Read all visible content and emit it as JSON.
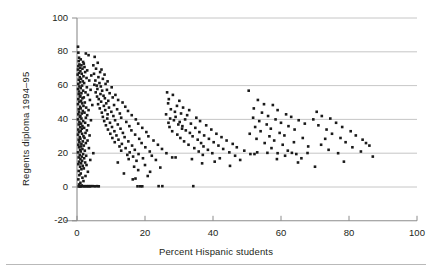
{
  "figure": {
    "background": "#ffffff",
    "ink_color": "#231f20",
    "grid_color": "#b8b8b8",
    "axis_color": "#8c8c8c",
    "point_color": "#1a1a1a"
  },
  "axes": {
    "x_title": "Percent Hispanic students",
    "y_title": "Regents diploma 1994–95",
    "x_ticklabels": [
      "0",
      "20",
      "40",
      "60",
      "80",
      "100"
    ],
    "y_ticklabels": [
      "-20",
      "0",
      "20",
      "40",
      "60",
      "80",
      "100"
    ]
  },
  "chart_data": {
    "type": "scatter",
    "title": "",
    "xlabel": "Percent Hispanic students",
    "ylabel": "Regents diploma 1994–95",
    "xlim": [
      0,
      100
    ],
    "ylim": [
      -20,
      100
    ],
    "xticks": [
      0,
      20,
      40,
      60,
      80,
      100
    ],
    "yticks": [
      -20,
      0,
      20,
      40,
      60,
      80,
      100
    ],
    "grid": "horizontal",
    "gridlines_y": [
      0,
      20,
      40,
      60,
      80,
      100
    ],
    "legend": null,
    "marker": "square",
    "marker_size_px": 2.6,
    "n_points": 487,
    "points": [
      [
        0.3,
        83.0
      ],
      [
        0.4,
        79.5
      ],
      [
        2.6,
        79.0
      ],
      [
        3.4,
        78.0
      ],
      [
        0.6,
        76.5
      ],
      [
        1.1,
        75.5
      ],
      [
        0.5,
        74.5
      ],
      [
        1.8,
        74.0
      ],
      [
        2.0,
        73.0
      ],
      [
        0.7,
        72.5
      ],
      [
        1.3,
        72.0
      ],
      [
        0.4,
        71.5
      ],
      [
        2.2,
        71.0
      ],
      [
        0.9,
        70.5
      ],
      [
        1.6,
        70.0
      ],
      [
        0.3,
        69.5
      ],
      [
        3.0,
        69.0
      ],
      [
        1.0,
        68.5
      ],
      [
        2.4,
        68.0
      ],
      [
        0.6,
        67.5
      ],
      [
        1.4,
        67.0
      ],
      [
        0.2,
        66.5
      ],
      [
        4.2,
        66.0
      ],
      [
        1.9,
        65.5
      ],
      [
        0.8,
        65.0
      ],
      [
        2.8,
        64.5
      ],
      [
        1.2,
        64.0
      ],
      [
        0.5,
        63.5
      ],
      [
        3.6,
        63.0
      ],
      [
        1.7,
        62.5
      ],
      [
        0.9,
        62.0
      ],
      [
        2.1,
        61.5
      ],
      [
        0.4,
        61.0
      ],
      [
        5.1,
        60.5
      ],
      [
        1.5,
        60.0
      ],
      [
        0.7,
        59.5
      ],
      [
        2.9,
        59.0
      ],
      [
        1.1,
        58.5
      ],
      [
        0.3,
        58.0
      ],
      [
        4.0,
        57.5
      ],
      [
        1.8,
        57.0
      ],
      [
        0.6,
        56.5
      ],
      [
        2.5,
        56.0
      ],
      [
        1.3,
        55.5
      ],
      [
        0.5,
        55.0
      ],
      [
        3.2,
        54.5
      ],
      [
        1.0,
        54.0
      ],
      [
        0.8,
        53.5
      ],
      [
        2.0,
        53.0
      ],
      [
        1.6,
        52.5
      ],
      [
        0.4,
        52.0
      ],
      [
        3.8,
        51.5
      ],
      [
        1.2,
        51.0
      ],
      [
        0.7,
        50.5
      ],
      [
        2.3,
        50.0
      ],
      [
        1.5,
        49.5
      ],
      [
        0.3,
        49.0
      ],
      [
        4.5,
        48.5
      ],
      [
        1.9,
        48.0
      ],
      [
        0.9,
        47.5
      ],
      [
        2.7,
        47.0
      ],
      [
        1.1,
        46.5
      ],
      [
        0.5,
        46.0
      ],
      [
        3.4,
        45.5
      ],
      [
        1.7,
        45.0
      ],
      [
        0.6,
        44.5
      ],
      [
        2.2,
        44.0
      ],
      [
        1.4,
        43.5
      ],
      [
        0.4,
        43.0
      ],
      [
        3.0,
        42.5
      ],
      [
        1.0,
        42.0
      ],
      [
        0.8,
        41.5
      ],
      [
        2.6,
        41.0
      ],
      [
        1.3,
        40.5
      ],
      [
        0.3,
        40.0
      ],
      [
        4.1,
        39.5
      ],
      [
        1.8,
        39.0
      ],
      [
        0.7,
        38.5
      ],
      [
        2.4,
        38.0
      ],
      [
        1.2,
        37.5
      ],
      [
        0.5,
        37.0
      ],
      [
        3.3,
        36.5
      ],
      [
        1.6,
        36.0
      ],
      [
        0.9,
        35.5
      ],
      [
        2.1,
        35.0
      ],
      [
        1.4,
        34.5
      ],
      [
        0.4,
        34.0
      ],
      [
        2.9,
        33.5
      ],
      [
        1.1,
        33.0
      ],
      [
        0.6,
        32.5
      ],
      [
        2.5,
        32.0
      ],
      [
        1.5,
        31.5
      ],
      [
        0.3,
        31.0
      ],
      [
        3.7,
        30.5
      ],
      [
        1.9,
        30.0
      ],
      [
        0.8,
        29.5
      ],
      [
        2.2,
        29.0
      ],
      [
        1.0,
        28.5
      ],
      [
        0.5,
        28.0
      ],
      [
        3.1,
        27.5
      ],
      [
        1.7,
        27.0
      ],
      [
        0.7,
        26.5
      ],
      [
        2.6,
        26.0
      ],
      [
        1.3,
        25.5
      ],
      [
        0.4,
        25.0
      ],
      [
        2.0,
        24.5
      ],
      [
        1.2,
        24.0
      ],
      [
        0.6,
        23.5
      ],
      [
        3.5,
        23.0
      ],
      [
        1.6,
        22.5
      ],
      [
        0.9,
        22.0
      ],
      [
        2.3,
        21.5
      ],
      [
        1.1,
        21.0
      ],
      [
        0.3,
        20.5
      ],
      [
        4.8,
        20.0
      ],
      [
        1.8,
        19.5
      ],
      [
        0.8,
        19.0
      ],
      [
        2.7,
        18.5
      ],
      [
        1.4,
        18.0
      ],
      [
        0.5,
        17.5
      ],
      [
        2.1,
        17.0
      ],
      [
        1.0,
        16.5
      ],
      [
        3.9,
        16.0
      ],
      [
        1.5,
        15.5
      ],
      [
        0.6,
        15.0
      ],
      [
        2.4,
        14.5
      ],
      [
        1.2,
        14.0
      ],
      [
        0.4,
        13.5
      ],
      [
        2.8,
        13.0
      ],
      [
        1.7,
        12.5
      ],
      [
        0.9,
        12.0
      ],
      [
        2.0,
        11.0
      ],
      [
        1.3,
        10.5
      ],
      [
        0.5,
        9.5
      ],
      [
        3.2,
        9.0
      ],
      [
        1.1,
        8.0
      ],
      [
        0.7,
        7.0
      ],
      [
        2.5,
        6.5
      ],
      [
        1.6,
        5.5
      ],
      [
        0.4,
        4.5
      ],
      [
        1.9,
        3.5
      ],
      [
        1.0,
        2.5
      ],
      [
        0.6,
        1.5
      ],
      [
        1.4,
        0.9
      ],
      [
        0.8,
        0.6
      ],
      [
        2.2,
        0.5
      ],
      [
        2.9,
        0.5
      ],
      [
        3.5,
        0.5
      ],
      [
        4.1,
        0.5
      ],
      [
        4.7,
        0.5
      ],
      [
        1.2,
        0.4
      ],
      [
        1.7,
        0.4
      ],
      [
        2.4,
        0.4
      ],
      [
        3.1,
        0.4
      ],
      [
        3.8,
        0.4
      ],
      [
        0.5,
        0.3
      ],
      [
        1.0,
        0.3
      ],
      [
        5.3,
        0.4
      ],
      [
        5.9,
        0.5
      ],
      [
        6.4,
        0.4
      ],
      [
        5.2,
        77.0
      ],
      [
        6.1,
        73.5
      ],
      [
        4.8,
        72.0
      ],
      [
        5.6,
        70.0
      ],
      [
        7.2,
        69.5
      ],
      [
        6.8,
        68.0
      ],
      [
        5.0,
        67.0
      ],
      [
        8.1,
        66.5
      ],
      [
        6.3,
        65.0
      ],
      [
        7.6,
        64.0
      ],
      [
        5.4,
        63.0
      ],
      [
        9.0,
        62.5
      ],
      [
        6.6,
        61.5
      ],
      [
        8.4,
        61.0
      ],
      [
        5.8,
        60.0
      ],
      [
        7.0,
        59.5
      ],
      [
        10.2,
        59.0
      ],
      [
        6.0,
        58.0
      ],
      [
        8.8,
        57.5
      ],
      [
        7.4,
        57.0
      ],
      [
        5.5,
        56.0
      ],
      [
        9.6,
        55.5
      ],
      [
        6.9,
        55.0
      ],
      [
        11.3,
        54.5
      ],
      [
        7.8,
        54.0
      ],
      [
        5.9,
        53.5
      ],
      [
        10.5,
        53.0
      ],
      [
        8.2,
        52.5
      ],
      [
        6.4,
        52.0
      ],
      [
        12.1,
        51.5
      ],
      [
        9.2,
        51.0
      ],
      [
        7.1,
        50.5
      ],
      [
        13.4,
        50.0
      ],
      [
        8.6,
        49.5
      ],
      [
        6.2,
        49.0
      ],
      [
        10.9,
        48.5
      ],
      [
        7.9,
        48.0
      ],
      [
        14.2,
        47.5
      ],
      [
        9.4,
        47.0
      ],
      [
        6.7,
        46.5
      ],
      [
        11.8,
        46.0
      ],
      [
        8.3,
        45.5
      ],
      [
        15.0,
        45.0
      ],
      [
        10.1,
        44.5
      ],
      [
        7.3,
        44.0
      ],
      [
        12.6,
        43.5
      ],
      [
        9.0,
        43.0
      ],
      [
        16.1,
        42.5
      ],
      [
        10.7,
        42.0
      ],
      [
        7.6,
        41.5
      ],
      [
        13.0,
        41.0
      ],
      [
        8.9,
        40.5
      ],
      [
        17.3,
        40.0
      ],
      [
        11.2,
        39.5
      ],
      [
        8.0,
        39.0
      ],
      [
        14.5,
        38.5
      ],
      [
        9.7,
        38.0
      ],
      [
        18.0,
        37.5
      ],
      [
        12.0,
        37.0
      ],
      [
        8.5,
        36.5
      ],
      [
        15.4,
        36.0
      ],
      [
        10.3,
        35.5
      ],
      [
        19.2,
        35.0
      ],
      [
        12.8,
        34.5
      ],
      [
        9.1,
        34.0
      ],
      [
        16.0,
        33.5
      ],
      [
        11.0,
        33.0
      ],
      [
        20.4,
        32.5
      ],
      [
        13.5,
        32.0
      ],
      [
        9.8,
        31.5
      ],
      [
        17.1,
        31.0
      ],
      [
        11.6,
        30.5
      ],
      [
        21.0,
        30.0
      ],
      [
        14.0,
        29.5
      ],
      [
        10.4,
        29.0
      ],
      [
        18.3,
        28.5
      ],
      [
        12.2,
        28.0
      ],
      [
        22.5,
        27.5
      ],
      [
        15.1,
        27.0
      ],
      [
        11.1,
        26.5
      ],
      [
        19.0,
        26.0
      ],
      [
        13.2,
        25.5
      ],
      [
        23.8,
        25.0
      ],
      [
        16.2,
        24.5
      ],
      [
        12.5,
        24.0
      ],
      [
        20.1,
        23.5
      ],
      [
        14.3,
        23.0
      ],
      [
        25.0,
        22.5
      ],
      [
        17.0,
        22.0
      ],
      [
        13.0,
        21.5
      ],
      [
        21.4,
        21.0
      ],
      [
        15.5,
        20.5
      ],
      [
        26.3,
        20.0
      ],
      [
        18.1,
        19.5
      ],
      [
        14.8,
        19.0
      ],
      [
        22.0,
        18.5
      ],
      [
        16.5,
        18.0
      ],
      [
        28.0,
        17.5
      ],
      [
        19.4,
        17.0
      ],
      [
        15.2,
        16.5
      ],
      [
        23.2,
        16.0
      ],
      [
        17.5,
        15.5
      ],
      [
        12.0,
        14.5
      ],
      [
        20.0,
        13.0
      ],
      [
        16.8,
        12.0
      ],
      [
        24.5,
        11.5
      ],
      [
        18.0,
        10.0
      ],
      [
        21.5,
        9.0
      ],
      [
        13.8,
        8.0
      ],
      [
        17.2,
        5.0
      ],
      [
        20.8,
        6.5
      ],
      [
        16.4,
        4.5
      ],
      [
        24.0,
        0.5
      ],
      [
        25.1,
        0.5
      ],
      [
        18.6,
        0.4
      ],
      [
        19.2,
        0.4
      ],
      [
        34.2,
        0.5
      ],
      [
        17.8,
        0.4
      ],
      [
        26.5,
        56.0
      ],
      [
        28.2,
        54.5
      ],
      [
        27.0,
        52.0
      ],
      [
        30.1,
        51.0
      ],
      [
        26.8,
        49.5
      ],
      [
        29.4,
        48.0
      ],
      [
        31.2,
        47.0
      ],
      [
        27.6,
        46.0
      ],
      [
        33.0,
        45.5
      ],
      [
        28.8,
        44.5
      ],
      [
        30.6,
        43.5
      ],
      [
        26.2,
        43.0
      ],
      [
        32.4,
        42.5
      ],
      [
        29.0,
        41.5
      ],
      [
        35.1,
        41.0
      ],
      [
        27.4,
        40.5
      ],
      [
        31.8,
        40.0
      ],
      [
        28.5,
        39.5
      ],
      [
        36.2,
        39.0
      ],
      [
        30.2,
        38.5
      ],
      [
        26.9,
        38.0
      ],
      [
        33.5,
        37.5
      ],
      [
        29.8,
        37.0
      ],
      [
        38.0,
        36.5
      ],
      [
        31.0,
        36.0
      ],
      [
        27.2,
        35.5
      ],
      [
        34.8,
        35.0
      ],
      [
        30.9,
        34.5
      ],
      [
        39.5,
        34.0
      ],
      [
        32.0,
        33.5
      ],
      [
        28.0,
        33.0
      ],
      [
        36.0,
        32.5
      ],
      [
        33.2,
        32.0
      ],
      [
        41.0,
        31.5
      ],
      [
        29.5,
        31.0
      ],
      [
        37.4,
        30.5
      ],
      [
        34.0,
        30.0
      ],
      [
        42.5,
        29.5
      ],
      [
        30.4,
        29.0
      ],
      [
        38.8,
        28.5
      ],
      [
        35.5,
        28.0
      ],
      [
        44.0,
        27.5
      ],
      [
        31.5,
        27.0
      ],
      [
        40.2,
        26.5
      ],
      [
        36.5,
        26.0
      ],
      [
        45.8,
        25.5
      ],
      [
        32.8,
        25.0
      ],
      [
        41.6,
        24.5
      ],
      [
        37.2,
        24.0
      ],
      [
        47.0,
        23.5
      ],
      [
        34.5,
        23.0
      ],
      [
        43.0,
        22.5
      ],
      [
        38.5,
        22.0
      ],
      [
        49.2,
        21.5
      ],
      [
        35.8,
        21.0
      ],
      [
        44.8,
        20.5
      ],
      [
        39.8,
        20.0
      ],
      [
        51.0,
        19.5
      ],
      [
        37.0,
        19.0
      ],
      [
        46.5,
        18.5
      ],
      [
        29.0,
        17.5
      ],
      [
        42.0,
        17.0
      ],
      [
        33.8,
        16.5
      ],
      [
        48.0,
        16.0
      ],
      [
        40.5,
        15.0
      ],
      [
        45.0,
        12.5
      ],
      [
        36.8,
        14.0
      ],
      [
        50.5,
        57.0
      ],
      [
        53.2,
        51.5
      ],
      [
        55.0,
        49.0
      ],
      [
        57.6,
        48.5
      ],
      [
        52.0,
        46.5
      ],
      [
        59.0,
        45.5
      ],
      [
        54.4,
        44.0
      ],
      [
        61.5,
        43.0
      ],
      [
        56.2,
        42.0
      ],
      [
        63.0,
        41.5
      ],
      [
        51.8,
        41.0
      ],
      [
        58.4,
        40.0
      ],
      [
        65.2,
        39.5
      ],
      [
        53.6,
        39.0
      ],
      [
        60.0,
        38.0
      ],
      [
        67.0,
        37.5
      ],
      [
        55.8,
        37.0
      ],
      [
        62.2,
        36.0
      ],
      [
        52.4,
        35.5
      ],
      [
        57.0,
        34.5
      ],
      [
        64.0,
        34.0
      ],
      [
        54.0,
        33.0
      ],
      [
        59.6,
        32.0
      ],
      [
        50.8,
        31.5
      ],
      [
        61.0,
        30.5
      ],
      [
        56.6,
        30.0
      ],
      [
        66.4,
        29.0
      ],
      [
        52.8,
        28.5
      ],
      [
        58.0,
        27.5
      ],
      [
        63.8,
        26.5
      ],
      [
        55.2,
        26.0
      ],
      [
        60.5,
        25.0
      ],
      [
        68.0,
        24.0
      ],
      [
        57.2,
        23.0
      ],
      [
        62.0,
        21.5
      ],
      [
        53.0,
        20.5
      ],
      [
        59.0,
        20.0
      ],
      [
        64.5,
        19.5
      ],
      [
        61.2,
        18.5
      ],
      [
        66.0,
        17.0
      ],
      [
        52.2,
        19.5
      ],
      [
        56.0,
        20.2
      ],
      [
        63.2,
        20.2
      ],
      [
        67.8,
        20.1
      ],
      [
        58.8,
        16.5
      ],
      [
        65.0,
        14.5
      ],
      [
        70.5,
        44.5
      ],
      [
        72.0,
        42.0
      ],
      [
        74.5,
        40.5
      ],
      [
        76.2,
        38.0
      ],
      [
        71.0,
        36.5
      ],
      [
        78.0,
        35.5
      ],
      [
        73.4,
        34.0
      ],
      [
        80.5,
        33.0
      ],
      [
        75.0,
        31.5
      ],
      [
        82.0,
        30.5
      ],
      [
        77.5,
        29.0
      ],
      [
        84.0,
        28.0
      ],
      [
        79.0,
        26.5
      ],
      [
        71.8,
        25.0
      ],
      [
        86.0,
        24.5
      ],
      [
        81.0,
        23.5
      ],
      [
        74.0,
        22.0
      ],
      [
        83.5,
        21.0
      ],
      [
        76.8,
        20.0
      ],
      [
        87.0,
        18.0
      ],
      [
        69.5,
        40.0
      ],
      [
        73.0,
        28.5
      ],
      [
        85.0,
        26.0
      ],
      [
        78.5,
        15.0
      ],
      [
        70.0,
        12.0
      ]
    ]
  }
}
